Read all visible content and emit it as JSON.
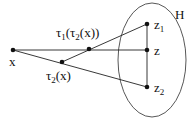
{
  "diagram": {
    "set_label": "H",
    "points": {
      "x": {
        "label": "x"
      },
      "t2x": {
        "label_base": "τ",
        "label_sub": "2",
        "label_rest": "(x)"
      },
      "t1t2x": {
        "label_base": "τ",
        "label_sub1": "1",
        "label_mid": "(τ",
        "label_sub2": "2",
        "label_rest": "(x))"
      },
      "z1": {
        "label_base": "z",
        "label_sub": "1"
      },
      "z": {
        "label": "z"
      },
      "z2": {
        "label_base": "z",
        "label_sub": "2"
      }
    },
    "colors": {
      "stroke": "#222222",
      "dot": "#111111",
      "background": "#ffffff"
    }
  }
}
